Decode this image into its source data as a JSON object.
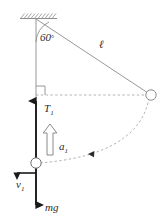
{
  "figure": {
    "kind": "physics-free-body-diagram",
    "colors": {
      "line_thin": "#8d8d8d",
      "line_dashed": "#a0a0a0",
      "vector_heavy": "#1a1a1a",
      "accel_outline": "#8a8a8a",
      "text": "#2b2b2b",
      "background": "#ffffff"
    }
  },
  "labels": {
    "angle": "60",
    "angle_unit": "°",
    "length": "ℓ",
    "tension": "T",
    "tension_sub": "1",
    "acceleration": "a",
    "acceleration_sub": "1",
    "velocity": "v",
    "velocity_sub": "1",
    "weight": "mg"
  },
  "elements": {
    "ceiling": "hatched-support",
    "pivot": "pivot-point",
    "string": "string-line",
    "angle_arc": "angle-arc-60",
    "right_angle": "right-angle-marker",
    "horizontal_dashed": "horizontal-reference-line",
    "bob_raised": "bob-at-release-position",
    "bob_lowest": "bob-at-lowest-position",
    "swing_path": "dashed-swing-arc",
    "swing_direction": "arc-direction-arrowhead",
    "tension_vector": "tension-arrow-up",
    "weight_vector": "weight-arrow-down",
    "accel_vector": "acceleration-block-arrow-up",
    "velocity_vector": "velocity-arrow-left"
  }
}
